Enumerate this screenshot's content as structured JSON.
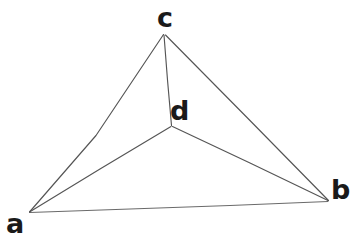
{
  "canvas": {
    "width": 353,
    "height": 239,
    "background_color": "#ffffff"
  },
  "figure": {
    "kind": "hand-drawn-geometry",
    "stroke_color": "#555555",
    "stroke_width": 1.1,
    "label_color": "#1a1a1a"
  },
  "points": {
    "a": {
      "label": "a",
      "x": 29,
      "y": 212
    },
    "b": {
      "label": "b",
      "x": 328,
      "y": 201
    },
    "c": {
      "label": "c",
      "x": 164,
      "y": 34
    },
    "d": {
      "label": "d",
      "x": 172,
      "y": 126
    }
  },
  "edges": [
    {
      "name": "edge-a-c",
      "from": "a",
      "to": "c"
    },
    {
      "name": "edge-c-b",
      "from": "c",
      "to": "b"
    },
    {
      "name": "edge-a-b",
      "from": "a",
      "to": "b"
    },
    {
      "name": "edge-c-d",
      "from": "c",
      "to": "d"
    },
    {
      "name": "edge-a-d",
      "from": "a",
      "to": "d"
    },
    {
      "name": "edge-d-b",
      "from": "d",
      "to": "b"
    }
  ]
}
